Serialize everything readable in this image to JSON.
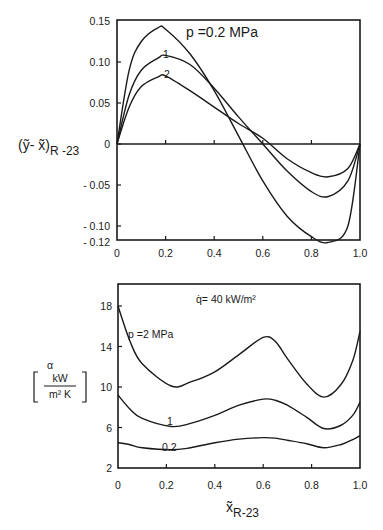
{
  "chart_data": [
    {
      "type": "line",
      "title": "",
      "xlabel": "",
      "ylabel": "(ỹ - x̃)R-23",
      "ylabel_main": "(ỹ- x̃)",
      "ylabel_sub": "R -23",
      "xlim": [
        0,
        1.0
      ],
      "ylim": [
        -0.12,
        0.15
      ],
      "grid": false,
      "x_ticks": [
        "0",
        "0.2",
        "0.4",
        "0.6",
        "0.8",
        "1.0"
      ],
      "y_ticks": [
        "0.15",
        "0.10",
        "0.05",
        "0",
        "- 0.05",
        "- 0.10",
        "- 0.12"
      ],
      "annotations": [
        "p =0.2 MPa",
        "1",
        "2"
      ],
      "x": [
        0,
        0.05,
        0.1,
        0.17,
        0.2,
        0.3,
        0.4,
        0.5,
        0.6,
        0.7,
        0.8,
        0.87,
        0.95,
        1.0
      ],
      "series": [
        {
          "name": "p = 0.2 MPa",
          "values": [
            0,
            0.09,
            0.125,
            0.142,
            0.14,
            0.11,
            0.065,
            0.01,
            -0.045,
            -0.088,
            -0.113,
            -0.12,
            -0.1,
            0
          ]
        },
        {
          "name": "p = 1 MPa",
          "values": [
            0,
            0.06,
            0.09,
            0.105,
            0.108,
            0.097,
            0.068,
            0.033,
            0.0,
            -0.033,
            -0.058,
            -0.064,
            -0.045,
            0
          ]
        },
        {
          "name": "p = 2 MPa",
          "values": [
            0,
            0.045,
            0.07,
            0.082,
            0.083,
            0.065,
            0.045,
            0.025,
            0.007,
            -0.018,
            -0.035,
            -0.04,
            -0.03,
            0
          ]
        }
      ]
    },
    {
      "type": "line",
      "title": "",
      "xlabel": "x̃R-23",
      "xlabel_main": "x̃",
      "xlabel_sub": "R-23",
      "ylabel": "α [kW / m² K]",
      "ylabel_symbol": "α",
      "ylabel_num": "kW",
      "ylabel_den": "m² K",
      "xlim": [
        0,
        1.0
      ],
      "ylim": [
        2,
        20
      ],
      "grid": false,
      "x_ticks": [
        "0",
        "0.2",
        "0.4",
        "0.6",
        "0.8",
        "1.0"
      ],
      "y_ticks": [
        "18",
        "14",
        "10",
        "6",
        "2"
      ],
      "annotations": [
        "q̇= 40 kW/m²",
        "p =2 MPa",
        "1",
        "0.2"
      ],
      "x": [
        0,
        0.05,
        0.1,
        0.22,
        0.3,
        0.4,
        0.5,
        0.6,
        0.65,
        0.7,
        0.78,
        0.85,
        0.92,
        0.97,
        1.0
      ],
      "series": [
        {
          "name": "p = 2 MPa",
          "values": [
            18,
            14.5,
            12.3,
            10.1,
            10.5,
            11.5,
            13.2,
            14.9,
            14.5,
            12.8,
            10.3,
            9.0,
            10.2,
            12.6,
            15.5
          ]
        },
        {
          "name": "p = 1 MPa",
          "values": [
            9.2,
            7.8,
            6.9,
            6.1,
            6.4,
            7.2,
            8.2,
            8.8,
            8.7,
            8.2,
            7.0,
            5.9,
            6.2,
            7.2,
            8.5
          ]
        },
        {
          "name": "p = 0.2 MPa",
          "values": [
            4.5,
            4.3,
            4.0,
            3.8,
            4.0,
            4.5,
            4.85,
            5.0,
            4.95,
            4.75,
            4.4,
            4.0,
            4.3,
            4.8,
            5.2
          ]
        }
      ]
    }
  ]
}
